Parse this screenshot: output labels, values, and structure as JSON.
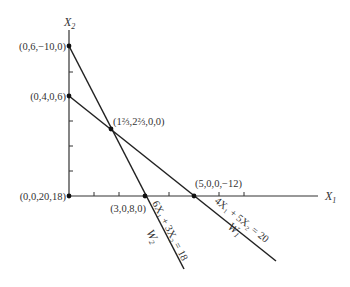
{
  "diagram": {
    "type": "linear-programming-feasible-region",
    "axes": {
      "x_label": "X",
      "x_sub": "1",
      "y_label": "X",
      "y_sub": "2"
    },
    "points": [
      {
        "id": "p-0-6",
        "label": "(0,6,−10,0)",
        "x": 0,
        "y": 6
      },
      {
        "id": "p-0-4",
        "label": "(0,4,0,6)",
        "x": 0,
        "y": 4
      },
      {
        "id": "p-int",
        "label": "(1⅔,2⅔,0,0)",
        "x": 1.6667,
        "y": 2.6667
      },
      {
        "id": "p-origin",
        "label": "(0,0,20,18)",
        "x": 0,
        "y": 0
      },
      {
        "id": "p-3-0",
        "label": "(3,0,8,0)",
        "x": 3,
        "y": 0
      },
      {
        "id": "p-5-0",
        "label": "(5,0,0,−12)",
        "x": 5,
        "y": 0
      }
    ],
    "lines": [
      {
        "id": "w1",
        "name": "W",
        "name_sub": "1",
        "equation": "4X₁ + 5X₂ = 20"
      },
      {
        "id": "w2",
        "name": "W",
        "name_sub": "2",
        "equation": "6X₁ + 3X₂ = 18"
      }
    ]
  }
}
